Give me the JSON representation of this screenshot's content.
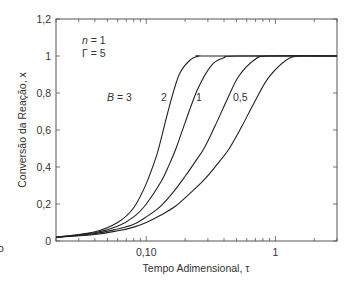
{
  "chart_data": {
    "type": "line",
    "title": "",
    "xlabel": "Tempo Adimensional, τ",
    "ylabel": "Conversão da Reação, x",
    "xscale": "log",
    "xlim": [
      0.02,
      3.0
    ],
    "ylim": [
      0,
      1.2
    ],
    "grid": false,
    "legend": "inline labels",
    "x_ticks": [
      {
        "value": 0.1,
        "label": "0,10"
      },
      {
        "value": 1,
        "label": "1"
      }
    ],
    "y_ticks": [
      {
        "value": 0,
        "label": "0"
      },
      {
        "value": 0.2,
        "label": "0,2"
      },
      {
        "value": 0.4,
        "label": "0,4"
      },
      {
        "value": 0.6,
        "label": "0,6"
      },
      {
        "value": 0.8,
        "label": "0,8"
      },
      {
        "value": 1.0,
        "label": "1"
      },
      {
        "value": 1.2,
        "label": "1,2"
      }
    ],
    "annotations": [
      {
        "text_italic": "n",
        "text": " = 1"
      },
      {
        "text_italic": "",
        "text": "Γ = 5"
      }
    ],
    "series": [
      {
        "name": "B = 3",
        "label": "B = 3",
        "label_italic": "B",
        "label_rest": " = 3",
        "tau": [
          0.02,
          0.04,
          0.06,
          0.08,
          0.1,
          0.12,
          0.13,
          0.15,
          0.18,
          0.22,
          0.26,
          0.3,
          3.0
        ],
        "x": [
          0.02,
          0.05,
          0.1,
          0.18,
          0.31,
          0.46,
          0.55,
          0.72,
          0.9,
          0.98,
          1.0,
          1.0,
          1.0
        ]
      },
      {
        "name": "B = 2",
        "label": "2",
        "tau": [
          0.02,
          0.04,
          0.06,
          0.08,
          0.1,
          0.13,
          0.15,
          0.17,
          0.2,
          0.25,
          0.32,
          0.4,
          0.5,
          3.0
        ],
        "x": [
          0.02,
          0.045,
          0.08,
          0.13,
          0.2,
          0.32,
          0.41,
          0.5,
          0.64,
          0.82,
          0.95,
          0.99,
          1.0,
          1.0
        ]
      },
      {
        "name": "B = 1",
        "label": "1",
        "tau": [
          0.02,
          0.04,
          0.06,
          0.08,
          0.1,
          0.13,
          0.16,
          0.2,
          0.24,
          0.28,
          0.34,
          0.42,
          0.52,
          0.69,
          0.9,
          3.0
        ],
        "x": [
          0.02,
          0.04,
          0.065,
          0.09,
          0.13,
          0.19,
          0.26,
          0.35,
          0.43,
          0.5,
          0.62,
          0.76,
          0.89,
          0.98,
          1.0,
          1.0
        ]
      },
      {
        "name": "B = 0,5",
        "label": "0,5",
        "tau": [
          0.02,
          0.04,
          0.06,
          0.08,
          0.1,
          0.13,
          0.17,
          0.22,
          0.28,
          0.35,
          0.44,
          0.55,
          0.7,
          0.9,
          1.3,
          1.8,
          3.0
        ],
        "x": [
          0.02,
          0.035,
          0.055,
          0.075,
          0.1,
          0.14,
          0.19,
          0.26,
          0.33,
          0.41,
          0.5,
          0.62,
          0.76,
          0.89,
          0.99,
          1.0,
          1.0
        ]
      }
    ]
  },
  "fragment": {
    "text": "o"
  }
}
